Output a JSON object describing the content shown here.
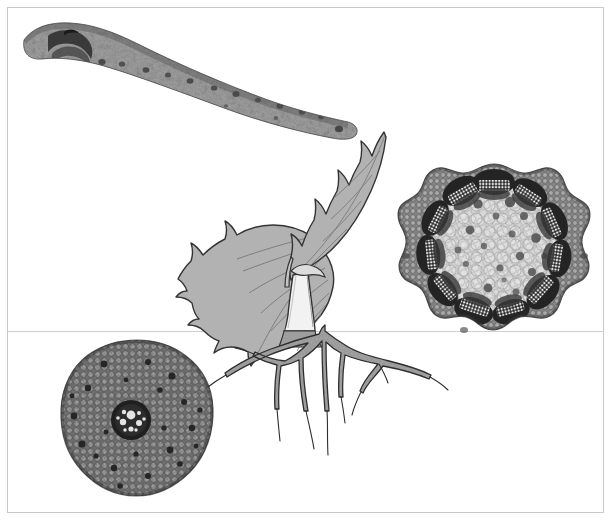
{
  "figure": {
    "background_color": "#ffffff",
    "frame_color": "#c9c9c9",
    "divider_color": "#cfcfcf",
    "ink_color": "#222222",
    "tissue_light": "#d8d8d8",
    "tissue_mid": "#9a9a9a",
    "tissue_dark": "#4a4a4a",
    "leaf_fill": "#b2b2b2"
  },
  "panels": [
    {
      "id": "leaf-cross-section",
      "name": "Leaf blade transverse section",
      "position": "top-left",
      "description": "Elongate tapering leaf blade in transverse section with midrib vascular arc at left and scattered minor veins along the lamina",
      "features": [
        "midrib",
        "vascular-bundle",
        "mesophyll",
        "epidermis",
        "lateral-veins"
      ]
    },
    {
      "id": "stem-cross-section",
      "name": "Stem transverse section",
      "position": "right",
      "description": "Circular stem section with a ring of collateral vascular bundles capped by dark sclerenchyma fibres, wide parenchymatous pith with scattered idioblasts, and a crenate epidermal outline",
      "features": [
        "epidermis",
        "cortex",
        "vascular-bundle-ring",
        "sclerenchyma-cap",
        "xylem",
        "phloem",
        "pith"
      ],
      "bundle_count": 11
    },
    {
      "id": "root-cross-section",
      "name": "Root transverse section",
      "position": "bottom-left",
      "description": "Rounded root section with broad parenchymatous cortex and a small dark central stele containing light xylem elements",
      "features": [
        "epidermis",
        "cortex",
        "endodermis",
        "stele",
        "xylem"
      ]
    },
    {
      "id": "seedling-habit",
      "name": "Seedling habit drawing",
      "position": "center",
      "description": "Line drawing of a young seedling with a pale upright stem, two serrate-margined leaves and a branching tap root system below the soil line",
      "features": [
        "leaf",
        "petiole",
        "stem",
        "node",
        "tap-root",
        "lateral-root",
        "root-hairs"
      ]
    }
  ],
  "icons": {
    "leaf_section": "leaf-cross-section-icon",
    "stem_section": "stem-cross-section-icon",
    "root_section": "root-cross-section-icon",
    "seedling": "seedling-icon"
  }
}
